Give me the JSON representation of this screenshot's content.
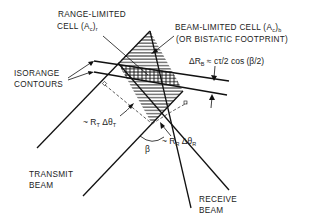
{
  "diagram": {
    "labels": {
      "range_limited_line1": "RANGE-LIMITED",
      "range_limited_line2_prefix": "CELL (A",
      "range_limited_sub": "c",
      "range_limited_suffix": ")",
      "range_limited_sub2": "r",
      "beam_limited_line1_prefix": "BEAM-LIMITED CELL (A",
      "beam_limited_sub": "c",
      "beam_limited_suffix": ")",
      "beam_limited_sub2": "b",
      "beam_limited_line2": "(OR BISTATIC FOOTPRINT)",
      "isorange_line1": "ISORANGE",
      "isorange_line2": "CONTOURS",
      "delta_rb_prefix": "ΔR",
      "delta_rb_sub": "B",
      "delta_rb_formula": " ≈ cτ/2 cos (β/2)",
      "rt_prefix": "~ R",
      "rt_sub": "T",
      "rt_mid": " Δθ",
      "rt_sub2": "T",
      "rr_prefix": "~ R",
      "rr_sub": "R",
      "rr_mid": " Δθ",
      "rr_sub2": "R",
      "beta": "β",
      "transmit_line1": "TRANSMIT",
      "transmit_line2": "BEAM",
      "receive_line1": "RECEIVE",
      "receive_line2": "BEAM"
    },
    "colors": {
      "ink": "#111111",
      "background": "#ffffff"
    }
  }
}
